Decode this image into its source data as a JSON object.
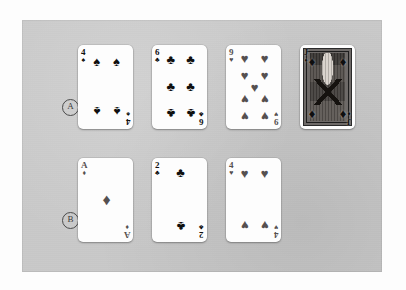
{
  "figure": {
    "panel_background": "#c9c9c9",
    "page_background": "#fdfdfd",
    "black_suit_color": "#101010",
    "red_suit_color": "#555050"
  },
  "rows": [
    {
      "label": "A",
      "name": "row-a"
    },
    {
      "label": "B",
      "name": "row-b"
    }
  ],
  "cards": {
    "a1": {
      "rank": "4",
      "suit_name": "spades",
      "suit_glyph": "♠",
      "color_class": "black",
      "label": "four-of-spades"
    },
    "a2": {
      "rank": "6",
      "suit_name": "clubs",
      "suit_glyph": "♣",
      "color_class": "black",
      "label": "six-of-clubs"
    },
    "a3": {
      "rank": "9",
      "suit_name": "hearts",
      "suit_glyph": "♥",
      "color_class": "red",
      "label": "nine-of-hearts"
    },
    "a4": {
      "rank": "J",
      "suit_name": "diamonds",
      "suit_glyph": "♦",
      "color_class": "red",
      "label": "jack-of-diamonds"
    },
    "b1": {
      "rank": "A",
      "suit_name": "diamonds",
      "suit_glyph": "♦",
      "color_class": "red",
      "label": "ace-of-diamonds"
    },
    "b2": {
      "rank": "2",
      "suit_name": "clubs",
      "suit_glyph": "♣",
      "color_class": "black",
      "label": "two-of-clubs"
    },
    "b3": {
      "rank": "4",
      "suit_name": "hearts",
      "suit_glyph": "♥",
      "color_class": "red",
      "label": "four-of-hearts"
    }
  }
}
